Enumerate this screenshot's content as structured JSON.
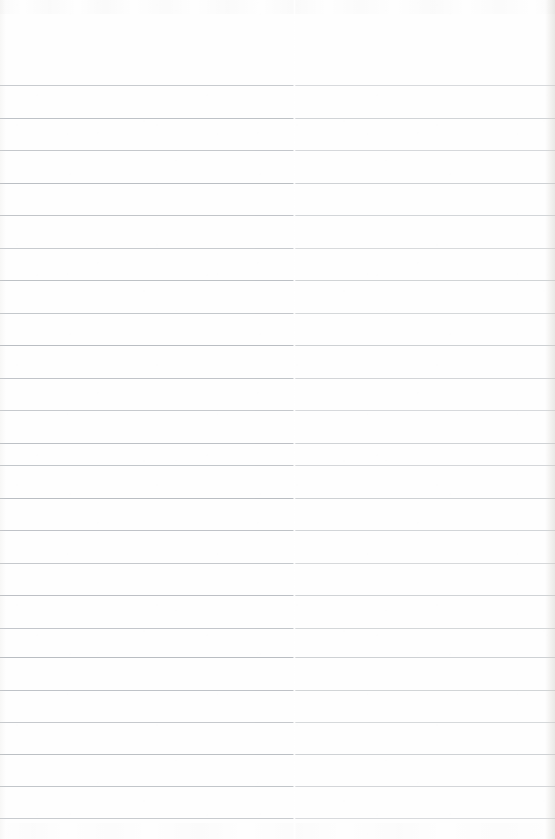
{
  "document": {
    "kind": "scanned-lined-paper",
    "title": "Blank ruled notebook page",
    "written_text": "",
    "page_width": 555,
    "page_height": 839,
    "background_color": "#fefefe",
    "rule_color": "#b9bdc2",
    "rule_thickness_px": 1,
    "rule_spacing_px": 32.5,
    "top_margin_px": 85,
    "bottom_margin_px": 21,
    "rule_count": 23,
    "scan_seam_x": 293,
    "rule_positions": [
      85,
      118,
      150,
      183,
      215,
      248,
      280,
      313,
      345,
      378,
      410,
      443,
      465,
      498,
      530,
      563,
      595,
      628,
      657,
      690,
      722,
      754,
      786,
      818
    ]
  }
}
